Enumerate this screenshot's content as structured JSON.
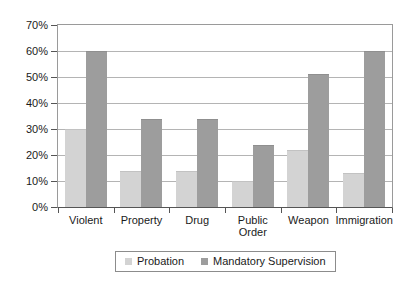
{
  "chart_data": {
    "type": "bar",
    "title": "",
    "subtitle": "",
    "xlabel": "",
    "ylabel": "",
    "categories": [
      "Violent",
      "Property",
      "Drug",
      "Public\nOrder",
      "Weapon",
      "Immigration"
    ],
    "series": [
      {
        "name": "Probation",
        "color": "#d3d3d3",
        "values": [
          30,
          14,
          14,
          10,
          22,
          13
        ]
      },
      {
        "name": "Mandatory Supervision",
        "color": "#9d9d9d",
        "values": [
          60,
          34,
          34,
          24,
          51,
          60
        ]
      }
    ],
    "ylim": [
      0,
      70
    ],
    "ytick_values": [
      0,
      10,
      20,
      30,
      40,
      50,
      60,
      70
    ],
    "ytick_labels": [
      "0%",
      "10%",
      "20%",
      "30%",
      "40%",
      "50%",
      "60%",
      "70%"
    ],
    "grid": "horizontal",
    "legend_position": "bottom-center",
    "legend_entries": [
      "Probation",
      "Mandatory Supervision"
    ]
  },
  "axis": {
    "y_labels": [
      "70%",
      "60%",
      "50%",
      "40%",
      "30%",
      "20%",
      "10%",
      "0%"
    ],
    "x_labels": [
      "Violent",
      "Property",
      "Drug",
      "Public\nOrder",
      "Weapon",
      "Immigration"
    ]
  },
  "legend": {
    "items": [
      {
        "label": "Probation"
      },
      {
        "label": "Mandatory Supervision"
      }
    ]
  },
  "colors": {
    "probation": "#d3d3d3",
    "mandatory": "#9d9d9d",
    "gridline": "#b4b4b4",
    "axis": "#555555",
    "frame": "#9a9a9a"
  }
}
